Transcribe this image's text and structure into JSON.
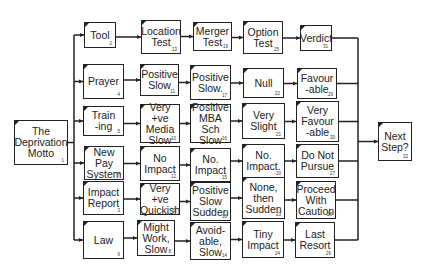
{
  "diagram": {
    "colors": {
      "stroke": "#222222",
      "background": "#ffffff"
    },
    "root": {
      "id": 1,
      "label": "The\nDeprivation\nMotto",
      "x": 14,
      "y": 120,
      "w": 54,
      "h": 45
    },
    "sink": {
      "id": 32,
      "label": "Next\nStep?",
      "x": 378,
      "y": 122,
      "w": 34,
      "h": 39
    },
    "rows": [
      {
        "nodes": [
          {
            "id": 2,
            "label": "Tool",
            "x": 84,
            "y": 22,
            "w": 32,
            "h": 26
          },
          {
            "id": 13,
            "label": "Location\nTest",
            "x": 141,
            "y": 20,
            "w": 40,
            "h": 34
          },
          {
            "id": 19,
            "label": "Merger\nTest",
            "x": 193,
            "y": 22,
            "w": 39,
            "h": 29
          },
          {
            "id": 25,
            "label": "Option\nTest",
            "x": 243,
            "y": 21,
            "w": 40,
            "h": 33
          },
          {
            "id": 31,
            "label": "Verdict",
            "x": 300,
            "y": 25,
            "w": 32,
            "h": 26
          }
        ]
      },
      {
        "nodes": [
          {
            "id": 4,
            "label": "Prayer",
            "x": 83,
            "y": 64,
            "w": 41,
            "h": 35
          },
          {
            "id": 11,
            "label": "Positive\nSlow",
            "x": 140,
            "y": 64,
            "w": 39,
            "h": 32
          },
          {
            "id": 17,
            "label": "Positive\nSlow.",
            "x": 190,
            "y": 65,
            "w": 41,
            "h": 35
          },
          {
            "id": 22,
            "label": "Null",
            "x": 243,
            "y": 68,
            "w": 41,
            "h": 30
          },
          {
            "id": 29,
            "label": "Favour\n-able",
            "x": 297,
            "y": 68,
            "w": 40,
            "h": 31
          }
        ]
      },
      {
        "nodes": [
          {
            "id": 5,
            "label": "Train\n-ing",
            "x": 83,
            "y": 106,
            "w": 41,
            "h": 30
          },
          {
            "id": 10,
            "label": "Very +ve\nMedia\nSlow",
            "x": 140,
            "y": 104,
            "w": 40,
            "h": 39
          },
          {
            "id": 16,
            "label": "Positive\nMBA Sch\nSlow",
            "x": 190,
            "y": 104,
            "w": 41,
            "h": 39
          },
          {
            "id": 21,
            "label": "Very\nSlight",
            "x": 242,
            "y": 103,
            "w": 43,
            "h": 36
          },
          {
            "id": 30,
            "label": "Very\nFavour\n-able",
            "x": 296,
            "y": 101,
            "w": 43,
            "h": 41
          }
        ]
      },
      {
        "nodes": [
          {
            "id": 7,
            "label": "New Pay\nSystem",
            "x": 84,
            "y": 146,
            "w": 40,
            "h": 34
          },
          {
            "id": 12,
            "label": "No\nImpact",
            "x": 140,
            "y": 146,
            "w": 40,
            "h": 35
          },
          {
            "id": 15,
            "label": "No.\nImpact",
            "x": 190,
            "y": 148,
            "w": 41,
            "h": 34
          },
          {
            "id": 20,
            "label": "No.\nImpact.",
            "x": 242,
            "y": 144,
            "w": 43,
            "h": 34
          },
          {
            "id": 27,
            "label": "Do Not\nPursue",
            "x": 296,
            "y": 144,
            "w": 43,
            "h": 34
          }
        ]
      },
      {
        "nodes": [
          {
            "id": 3,
            "label": "Impact\nReport",
            "x": 83,
            "y": 181,
            "w": 41,
            "h": 34
          },
          {
            "id": 9,
            "label": "Very +ve\nQuickish",
            "x": 140,
            "y": 183,
            "w": 40,
            "h": 32
          },
          {
            "id": 18,
            "label": "Positive\nSlow\nSudden",
            "x": 190,
            "y": 182,
            "w": 41,
            "h": 39
          },
          {
            "id": 23,
            "label": "None,\nthen\nSudden",
            "x": 242,
            "y": 177,
            "w": 43,
            "h": 42
          },
          {
            "id": 28,
            "label": "Proceed\nWith\nCaution",
            "x": 296,
            "y": 181,
            "w": 40,
            "h": 38
          }
        ]
      },
      {
        "nodes": [
          {
            "id": 6,
            "label": "Law",
            "x": 83,
            "y": 221,
            "w": 41,
            "h": 38
          },
          {
            "id": 8,
            "label": "Might\nWork,\nSlow",
            "x": 137,
            "y": 220,
            "w": 38,
            "h": 36
          },
          {
            "id": 14,
            "label": "Avoid-\nable,\nSlow",
            "x": 190,
            "y": 222,
            "w": 41,
            "h": 38
          },
          {
            "id": 24,
            "label": "Tiny\nImpact",
            "x": 242,
            "y": 221,
            "w": 42,
            "h": 37
          },
          {
            "id": 26,
            "label": "Last\nResort",
            "x": 295,
            "y": 222,
            "w": 40,
            "h": 36
          }
        ]
      }
    ]
  }
}
